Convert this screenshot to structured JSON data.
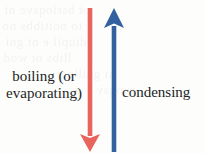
{
  "figure": {
    "type": "diagram",
    "background_color": "#fdfdfc"
  },
  "labels": {
    "left": {
      "line1": "boiling (or",
      "line2": "evaporating)",
      "color": "#221f1f"
    },
    "right": {
      "text": "condensing",
      "color": "#221f1f"
    }
  },
  "arrows": {
    "down": {
      "name": "boiling-arrow",
      "color": "#e8645c",
      "direction": "down",
      "x": 90,
      "top_y": 8,
      "tip_y": 152,
      "stroke_width": 4.6,
      "head_half_width": 10,
      "head_length": 18
    },
    "up": {
      "name": "condensing-arrow",
      "color": "#33609f",
      "direction": "up",
      "x": 114,
      "tip_y": 8,
      "bottom_y": 152,
      "stroke_width": 4.6,
      "head_half_width": 10,
      "head_length": 20
    }
  },
  "ghost_text": {
    "line1": "ot bsrioqsve ni",
    "line2": "to noitibbs no",
    "line3": "rdiupil e ni gni",
    "line4": "llibs ot wod",
    "line5": "ni gnilleq",
    "line6": "ruoqsv"
  }
}
